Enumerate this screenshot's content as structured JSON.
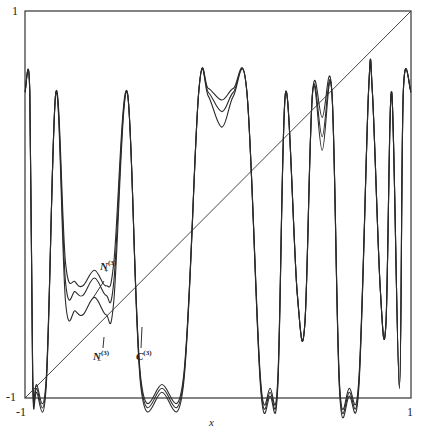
{
  "chart_data": {
    "type": "line",
    "title": "",
    "xlabel": "x",
    "ylabel": "",
    "xlim": [
      -1,
      1
    ],
    "ylim": [
      -1,
      1
    ],
    "grid": false,
    "legend": "inline annotations",
    "ticks": {
      "x": [
        "-1",
        "1"
      ],
      "y": [
        "-1",
        "1"
      ]
    },
    "annotations": [
      {
        "label": "N+(3)",
        "base": "N",
        "sub": "+",
        "sup": "(3)",
        "x": -0.69,
        "y": -0.28
      },
      {
        "label": "N-(3)",
        "base": "N",
        "sub": "−",
        "sup": "(3)",
        "x": -0.69,
        "y": -0.82
      },
      {
        "label": "C(3)",
        "base": "C",
        "sub": "",
        "sup": "(3)",
        "x": -0.47,
        "y": -0.82
      }
    ],
    "series": [
      {
        "name": "identity y=x",
        "x": [
          -1,
          1
        ],
        "y": [
          -1,
          1
        ]
      },
      {
        "name": "N+(3)",
        "x": [
          -1.0,
          -0.975,
          -0.96,
          -0.94,
          -0.89,
          -0.84,
          -0.79,
          -0.74,
          -0.7,
          -0.64,
          -0.58,
          -0.54,
          -0.47,
          -0.4,
          -0.29,
          -0.18,
          -0.1,
          -0.05,
          0.02,
          0.08,
          0.15,
          0.22,
          0.27,
          0.31,
          0.35,
          0.41,
          0.45,
          0.49,
          0.54,
          0.59,
          0.63,
          0.68,
          0.73,
          0.78,
          0.8,
          0.84,
          0.87,
          0.9,
          0.94,
          0.96,
          1.0
        ],
        "y": [
          0.58,
          0.58,
          -0.88,
          -0.93,
          -0.9,
          0.58,
          -0.3,
          -0.4,
          -0.42,
          -0.34,
          -0.42,
          -0.3,
          0.58,
          -0.9,
          -0.93,
          -0.9,
          0.58,
          0.6,
          0.54,
          0.6,
          0.58,
          -0.9,
          -0.95,
          -0.9,
          0.58,
          -0.45,
          -0.62,
          0.58,
          0.45,
          0.58,
          -0.93,
          -0.95,
          -0.9,
          0.58,
          0.58,
          -0.42,
          -0.62,
          0.58,
          -0.95,
          0.58,
          0.58
        ]
      },
      {
        "name": "C(3)",
        "x": [
          -1.0,
          -0.975,
          -0.96,
          -0.94,
          -0.89,
          -0.84,
          -0.79,
          -0.74,
          -0.7,
          -0.64,
          -0.58,
          -0.54,
          -0.47,
          -0.4,
          -0.29,
          -0.18,
          -0.1,
          -0.05,
          0.02,
          0.08,
          0.15,
          0.22,
          0.27,
          0.31,
          0.35,
          0.41,
          0.45,
          0.49,
          0.54,
          0.59,
          0.63,
          0.68,
          0.73,
          0.78,
          0.8,
          0.84,
          0.87,
          0.9,
          0.94,
          0.96,
          1.0
        ],
        "y": [
          0.58,
          0.58,
          -0.9,
          -0.95,
          -0.92,
          0.58,
          -0.4,
          -0.45,
          -0.47,
          -0.38,
          -0.47,
          -0.4,
          0.58,
          -0.92,
          -0.95,
          -0.92,
          0.58,
          0.58,
          0.48,
          0.58,
          0.58,
          -0.92,
          -0.97,
          -0.92,
          0.58,
          -0.45,
          -0.62,
          0.58,
          0.35,
          0.58,
          -0.95,
          -0.97,
          -0.92,
          0.58,
          0.58,
          -0.42,
          -0.62,
          0.58,
          -0.95,
          0.58,
          0.58
        ]
      },
      {
        "name": "N-(3)",
        "x": [
          -1.0,
          -0.975,
          -0.96,
          -0.94,
          -0.89,
          -0.84,
          -0.79,
          -0.74,
          -0.7,
          -0.64,
          -0.58,
          -0.54,
          -0.47,
          -0.4,
          -0.29,
          -0.18,
          -0.1,
          -0.05,
          0.02,
          0.08,
          0.15,
          0.22,
          0.27,
          0.31,
          0.35,
          0.41,
          0.45,
          0.49,
          0.54,
          0.59,
          0.63,
          0.68,
          0.73,
          0.78,
          0.8,
          0.84,
          0.87,
          0.9,
          0.94,
          0.96,
          1.0
        ],
        "y": [
          0.58,
          0.58,
          -0.92,
          -0.97,
          -0.94,
          0.58,
          -0.5,
          -0.55,
          -0.57,
          -0.48,
          -0.57,
          -0.5,
          0.58,
          -0.94,
          -0.97,
          -0.94,
          0.58,
          0.56,
          0.4,
          0.56,
          0.58,
          -0.94,
          -0.99,
          -0.94,
          0.58,
          -0.45,
          -0.62,
          0.58,
          0.28,
          0.58,
          -0.97,
          -0.99,
          -0.94,
          0.58,
          0.58,
          -0.42,
          -0.62,
          0.58,
          -0.95,
          0.58,
          0.58
        ]
      }
    ]
  }
}
